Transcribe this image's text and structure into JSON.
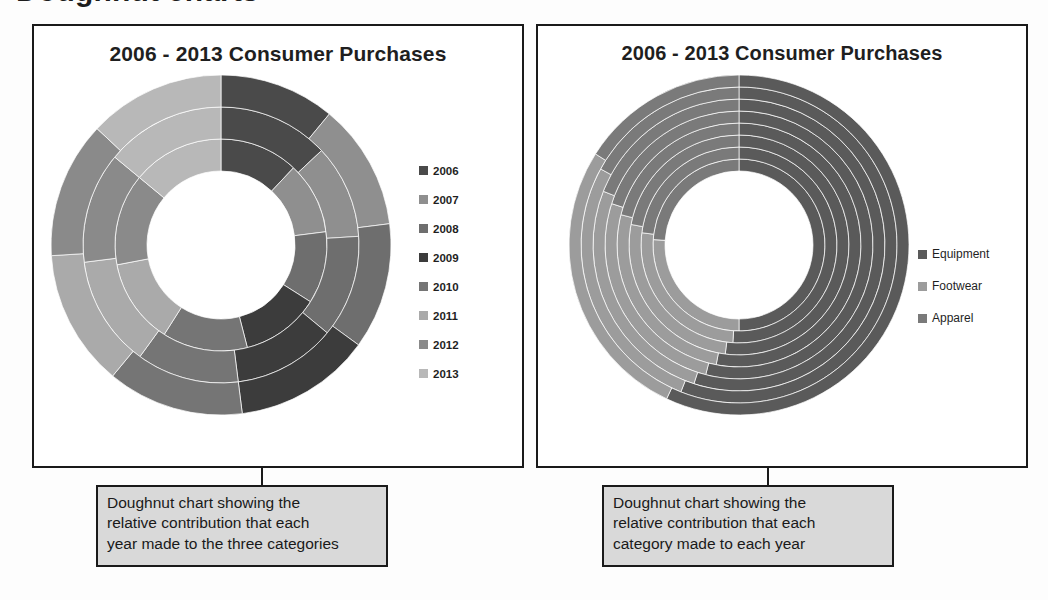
{
  "page": {
    "top_heading_remnant": "Doughnut charts"
  },
  "panels": [
    {
      "id": "left",
      "title": "2006 - 2013 Consumer Purchases",
      "caption_lines": [
        "Doughnut chart showing the",
        "relative contribution that each",
        "year made to the three categories"
      ],
      "legend": [
        {
          "label": "2006",
          "color": "#4a4a4a"
        },
        {
          "label": "2007",
          "color": "#8f8f8f"
        },
        {
          "label": "2008",
          "color": "#6e6e6e"
        },
        {
          "label": "2009",
          "color": "#3c3c3c"
        },
        {
          "label": "2010",
          "color": "#757575"
        },
        {
          "label": "2011",
          "color": "#aaaaaa"
        },
        {
          "label": "2012",
          "color": "#8a8a8a"
        },
        {
          "label": "2013",
          "color": "#b8b8b8"
        }
      ]
    },
    {
      "id": "right",
      "title": "2006 - 2013 Consumer Purchases",
      "caption_lines": [
        "Doughnut chart showing the",
        "relative contribution that each",
        "category made to each year"
      ],
      "legend": [
        {
          "label": "Equipment",
          "color": "#5a5a5a"
        },
        {
          "label": "Footwear",
          "color": "#9c9c9c"
        },
        {
          "label": "Apparel",
          "color": "#7a7a7a"
        }
      ]
    }
  ],
  "chart_data": [
    {
      "id": "left-doughnut",
      "type": "pie",
      "subtype": "multi-ring-doughnut",
      "title": "2006 - 2013 Consumer Purchases",
      "description": "Three concentric rings, one per category; each ring divided into eight year slices showing each year's share of that category.",
      "ring_order_inner_to_outer": [
        "Equipment",
        "Footwear",
        "Apparel"
      ],
      "categories": [
        "2006",
        "2007",
        "2008",
        "2009",
        "2010",
        "2011",
        "2012",
        "2013"
      ],
      "colors": [
        "#4a4a4a",
        "#8f8f8f",
        "#6e6e6e",
        "#3c3c3c",
        "#757575",
        "#aaaaaa",
        "#8a8a8a",
        "#b8b8b8"
      ],
      "series": [
        {
          "name": "Equipment",
          "values": [
            12,
            11,
            11,
            12,
            13,
            13,
            14,
            14
          ]
        },
        {
          "name": "Footwear",
          "values": [
            13,
            11,
            12,
            12,
            12,
            13,
            13,
            14
          ]
        },
        {
          "name": "Apparel",
          "values": [
            11,
            12,
            12,
            13,
            13,
            13,
            13,
            13
          ]
        }
      ],
      "units": "percent of ring",
      "start_angle_deg": 0,
      "direction": "clockwise",
      "legend_position": "right",
      "grid": false
    },
    {
      "id": "right-doughnut",
      "type": "pie",
      "subtype": "multi-ring-doughnut",
      "title": "2006 - 2013 Consumer Purchases",
      "description": "Eight concentric rings, one per year; each ring divided into three category slices showing each category's share of that year.",
      "ring_order_inner_to_outer": [
        "2006",
        "2007",
        "2008",
        "2009",
        "2010",
        "2011",
        "2012",
        "2013"
      ],
      "categories": [
        "Equipment",
        "Footwear",
        "Apparel"
      ],
      "colors": [
        "#5a5a5a",
        "#9c9c9c",
        "#7a7a7a"
      ],
      "series": [
        {
          "name": "2006",
          "values": [
            50,
            26,
            24
          ]
        },
        {
          "name": "2007",
          "values": [
            51,
            26,
            23
          ]
        },
        {
          "name": "2008",
          "values": [
            52,
            26,
            22
          ]
        },
        {
          "name": "2009",
          "values": [
            53,
            26,
            21
          ]
        },
        {
          "name": "2010",
          "values": [
            54,
            26,
            20
          ]
        },
        {
          "name": "2011",
          "values": [
            55,
            26,
            19
          ]
        },
        {
          "name": "2012",
          "values": [
            56,
            27,
            17
          ]
        },
        {
          "name": "2013",
          "values": [
            57,
            27,
            16
          ]
        }
      ],
      "units": "percent of ring",
      "start_angle_deg": 0,
      "direction": "clockwise",
      "legend_position": "right",
      "grid": false
    }
  ]
}
